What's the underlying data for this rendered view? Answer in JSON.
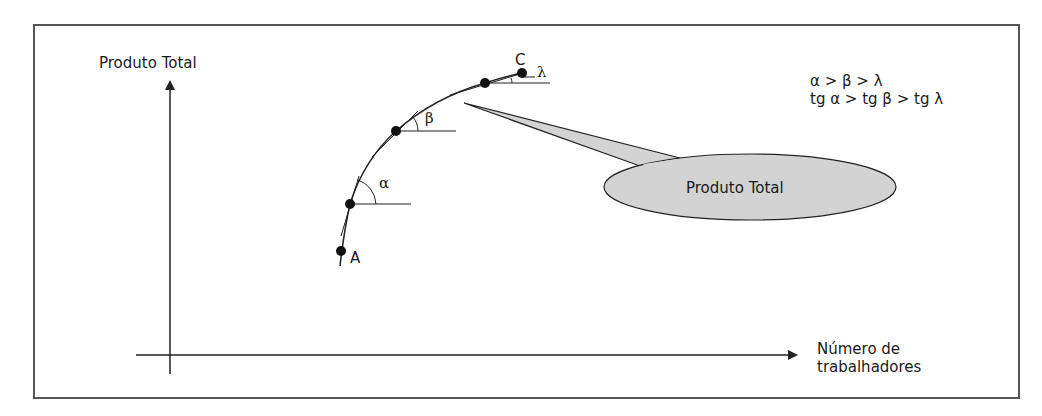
{
  "diagram": {
    "y_axis_label": "Produto Total",
    "x_axis_label_line1": "Número de",
    "x_axis_label_line2": "trabalhadores",
    "points": [
      {
        "name": "A",
        "label": "A"
      },
      {
        "name": "alpha-point",
        "angle_label": "α"
      },
      {
        "name": "beta-point",
        "angle_label": "β"
      },
      {
        "name": "third-point"
      },
      {
        "name": "C",
        "label": "C",
        "angle_label": "λ"
      }
    ],
    "relations": {
      "line1": "α > β > λ",
      "line2": "tg α > tg β > tg λ"
    },
    "callout": {
      "text": "Produto Total",
      "fill": "#d3d3d3"
    },
    "colors": {
      "stroke": "#222222",
      "frame": "#555555",
      "callout_fill": "#d3d3d3"
    }
  }
}
